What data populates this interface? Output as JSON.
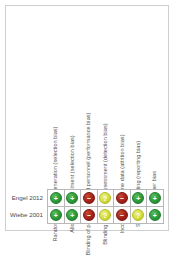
{
  "figure": {
    "type": "risk-of-bias-summary",
    "border_color": "#cfcfcf",
    "grid_line_color": "#b8b8b8"
  },
  "legend_colors": {
    "low": "#2e9b3c",
    "high": "#a52118",
    "unclear": "#d6dd3e"
  },
  "glyphs": {
    "low": "+",
    "high": "−",
    "unclear": "?"
  },
  "chart_data": {
    "type": "table",
    "title": "",
    "categories": [
      "Random sequence generation (selection bias)",
      "Allocation concealment (selection bias)",
      "Blinding of participants and personnel (performance bias)",
      "Blinding of outcome assessment (detection bias)",
      "Incomplete outcome data (attrition bias)",
      "Selective reporting (reporting bias)",
      "Other bias"
    ],
    "rows": [
      {
        "study": "Engel 2012",
        "judgements": [
          "low",
          "low",
          "high",
          "unclear",
          "high",
          "low",
          "low"
        ]
      },
      {
        "study": "Wiebe 2001",
        "judgements": [
          "low",
          "low",
          "high",
          "unclear",
          "high",
          "unclear",
          "low"
        ]
      }
    ]
  }
}
